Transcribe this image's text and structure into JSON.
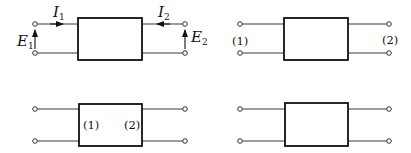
{
  "diagrams": [
    {
      "name": "two-port-with-variables",
      "labels": {
        "I1_main": "I",
        "I1_sub": "1",
        "I2_main": "I",
        "I2_sub": "2",
        "E1_main": "E",
        "E1_sub": "1",
        "E2_main": "E",
        "E2_sub": "2"
      }
    },
    {
      "name": "two-port-external-port-labels",
      "labels": {
        "port1": "(1)",
        "port2": "(2)"
      }
    },
    {
      "name": "two-port-internal-port-labels",
      "labels": {
        "port1": "(1)",
        "port2": "(2)"
      }
    },
    {
      "name": "two-port-plain",
      "labels": {}
    }
  ],
  "colors": {
    "line": "#111111",
    "background": "#ffffff"
  }
}
